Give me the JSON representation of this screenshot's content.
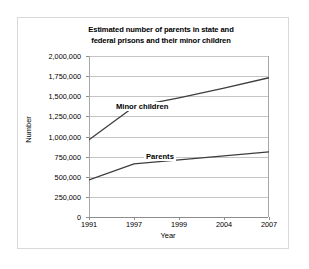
{
  "chart_data": {
    "type": "line",
    "title": "Estimated number of parents in state and federal prisons and their minor children",
    "title_line1": "Estimated number of parents in state and",
    "title_line2": "federal prisons and their minor children",
    "xlabel": "Year",
    "ylabel": "Number",
    "categories": [
      "1991",
      "1997",
      "1999",
      "2004",
      "2007"
    ],
    "ylim": [
      0,
      2000000
    ],
    "ytick_labels": [
      "0",
      "250,000",
      "500,000",
      "750,000",
      "1,000,000",
      "1,250,000",
      "1,500,000",
      "1,750,000",
      "2,000,000"
    ],
    "ytick_values": [
      0,
      250000,
      500000,
      750000,
      1000000,
      1250000,
      1500000,
      1750000,
      2000000
    ],
    "grid": true,
    "legend": "inline-labels",
    "series": [
      {
        "name": "Minor children",
        "values": [
          960000,
          1370000,
          1480000,
          1600000,
          1730000
        ],
        "color": "#3d3d3d"
      },
      {
        "name": "Parents",
        "values": [
          460000,
          660000,
          710000,
          760000,
          810000
        ],
        "color": "#3d3d3d"
      }
    ]
  }
}
